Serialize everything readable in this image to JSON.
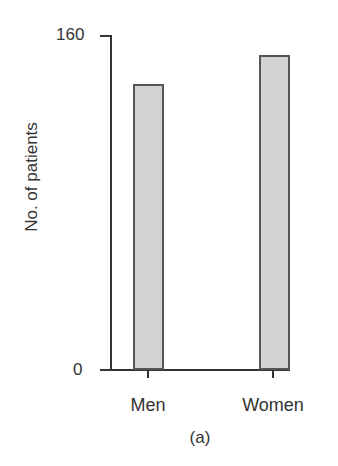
{
  "chart_data": {
    "type": "bar",
    "title": "",
    "caption": "(a)",
    "categories": [
      "Men",
      "Women"
    ],
    "values": [
      137,
      151
    ],
    "xlabel": "",
    "ylabel": "No. of patients",
    "ylim": [
      0,
      160
    ],
    "yticks": [
      "0",
      "160"
    ],
    "grid": false,
    "legend": null,
    "colors": {
      "bar_fill": "#d3d3d3",
      "bar_edge": "#555555",
      "axis": "#333333"
    }
  }
}
